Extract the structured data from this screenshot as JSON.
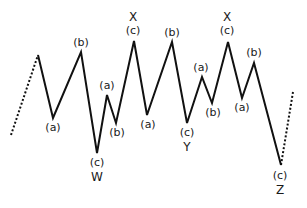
{
  "diagram": {
    "stroke_color": "#111111",
    "dotted_in": {
      "from": [
        11,
        135
      ],
      "to": [
        38,
        55
      ]
    },
    "path": [
      [
        38,
        55
      ],
      [
        53,
        118
      ],
      [
        81,
        52
      ],
      [
        97,
        153
      ],
      [
        107,
        95
      ],
      [
        116,
        123
      ],
      [
        134,
        41
      ],
      [
        147,
        115
      ],
      [
        172,
        42
      ],
      [
        187,
        123
      ],
      [
        202,
        77
      ],
      [
        212,
        103
      ],
      [
        228,
        42
      ],
      [
        242,
        98
      ],
      [
        254,
        63
      ],
      [
        281,
        165
      ]
    ],
    "dotted_out": {
      "from": [
        281,
        165
      ],
      "to": [
        293,
        92
      ]
    },
    "labels": [
      {
        "text": "(a)",
        "x": 53,
        "y": 122
      },
      {
        "text": "(b)",
        "x": 81,
        "y": 37
      },
      {
        "text": "(c)",
        "x": 97,
        "y": 157
      },
      {
        "text": "W",
        "x": 97,
        "y": 171
      },
      {
        "text": "(a)",
        "x": 107,
        "y": 80
      },
      {
        "text": "(b)",
        "x": 117,
        "y": 127
      },
      {
        "text": "X",
        "x": 133,
        "y": 11
      },
      {
        "text": "(c)",
        "x": 133,
        "y": 25
      },
      {
        "text": "(a)",
        "x": 148,
        "y": 119
      },
      {
        "text": "(b)",
        "x": 172,
        "y": 27
      },
      {
        "text": "(c)",
        "x": 187,
        "y": 127
      },
      {
        "text": "Y",
        "x": 187,
        "y": 141
      },
      {
        "text": "(a)",
        "x": 201,
        "y": 62
      },
      {
        "text": "(b)",
        "x": 213,
        "y": 107
      },
      {
        "text": "X",
        "x": 227,
        "y": 11
      },
      {
        "text": "(c)",
        "x": 227,
        "y": 25
      },
      {
        "text": "(a)",
        "x": 242,
        "y": 102
      },
      {
        "text": "(b)",
        "x": 254,
        "y": 47
      },
      {
        "text": "(c)",
        "x": 280,
        "y": 170
      },
      {
        "text": "Z",
        "x": 280,
        "y": 184
      }
    ]
  }
}
